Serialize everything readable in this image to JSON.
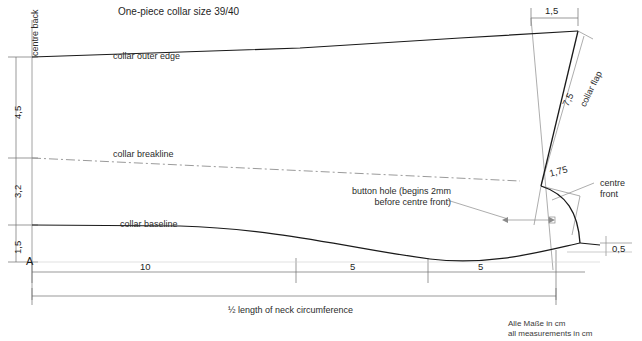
{
  "diagram": {
    "title": "One-piece collar size 39/40",
    "kind": "sewing-pattern",
    "footer": {
      "line_de": "Alle Maße in cm",
      "line_en": "all measurements in cm"
    },
    "labels": {
      "centre_back": "centre back",
      "collar_outer_edge": "collar outer edge",
      "collar_breakline": "collar breakline",
      "collar_baseline": "collar baseline",
      "collar_flap": "collar flap",
      "centre_front_line1": "centre",
      "centre_front_line2": "front",
      "button_hole_line1": "button hole (begins 2mm",
      "button_hole_line2": "before centre front)",
      "neck_circumference": "½ length of neck circumference",
      "point_a": "A"
    },
    "dimensions": {
      "vertical": [
        {
          "name": "outer-edge-to-breakline",
          "value": "4,5"
        },
        {
          "name": "breakline-to-baseline",
          "value": "3,2"
        },
        {
          "name": "baseline-to-point-a",
          "value": "1,5"
        }
      ],
      "horizontal_chain": [
        {
          "name": "segment-1",
          "value": "10"
        },
        {
          "name": "segment-2",
          "value": "5"
        },
        {
          "name": "segment-3",
          "value": "5"
        }
      ],
      "flap_top_width": "1,5",
      "flap_length": "7,5",
      "flap_notch": "1,75",
      "front_drop": "0,5"
    },
    "colors": {
      "outline": "#1a1a1a",
      "construction": "#8a8a8a",
      "dimension": "#6e6e6e",
      "text": "#2b2b2b",
      "background": "#ffffff"
    }
  }
}
